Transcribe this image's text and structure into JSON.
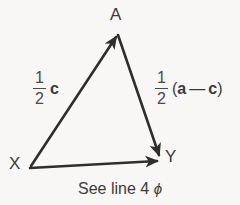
{
  "figure": {
    "background_color": "#f8f7f5",
    "stroke_color": "#2e2e2e",
    "text_color": "#3b3b3b"
  },
  "vertices": [
    {
      "id": "A",
      "label": "A",
      "x": 117,
      "y": 33
    },
    {
      "id": "X",
      "label": "X",
      "x": 30,
      "y": 167
    },
    {
      "id": "Y",
      "label": "Y",
      "x": 160,
      "y": 159
    }
  ],
  "vectors": [
    {
      "name": "X-to-A",
      "from": "X",
      "to": "A",
      "arrowhead_at": "A",
      "label": {
        "coefficient_numerator": "1",
        "coefficient_denominator": "2",
        "body": "c"
      }
    },
    {
      "name": "A-to-Y",
      "from": "A",
      "to": "Y",
      "arrowhead_at": "Y",
      "label": {
        "coefficient_numerator": "1",
        "coefficient_denominator": "2",
        "open_paren": "(",
        "term1": "a",
        "operator": "—",
        "term2": "c",
        "close_paren": ")"
      }
    },
    {
      "name": "X-to-Y",
      "from": "X",
      "to": "Y",
      "arrowhead_at": "Y",
      "label": null
    }
  ],
  "caption": {
    "text": "See line 4",
    "symbol": "ϕ"
  }
}
